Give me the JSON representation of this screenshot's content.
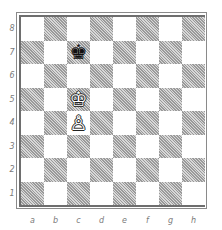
{
  "board": {
    "files": [
      "a",
      "b",
      "c",
      "d",
      "e",
      "f",
      "g",
      "h"
    ],
    "ranks": [
      "8",
      "7",
      "6",
      "5",
      "4",
      "3",
      "2",
      "1"
    ],
    "colors": {
      "light_square": "#ffffff",
      "dark_square": "#c4c4c4",
      "border": "#6e6e6e",
      "label": "#7a7a7a"
    },
    "pieces": [
      {
        "square": "c7",
        "color": "black",
        "type": "king",
        "glyph": "♚"
      },
      {
        "square": "c5",
        "color": "white",
        "type": "king",
        "glyph": "♔"
      },
      {
        "square": "c4",
        "color": "white",
        "type": "pawn",
        "glyph": "♙"
      }
    ]
  }
}
